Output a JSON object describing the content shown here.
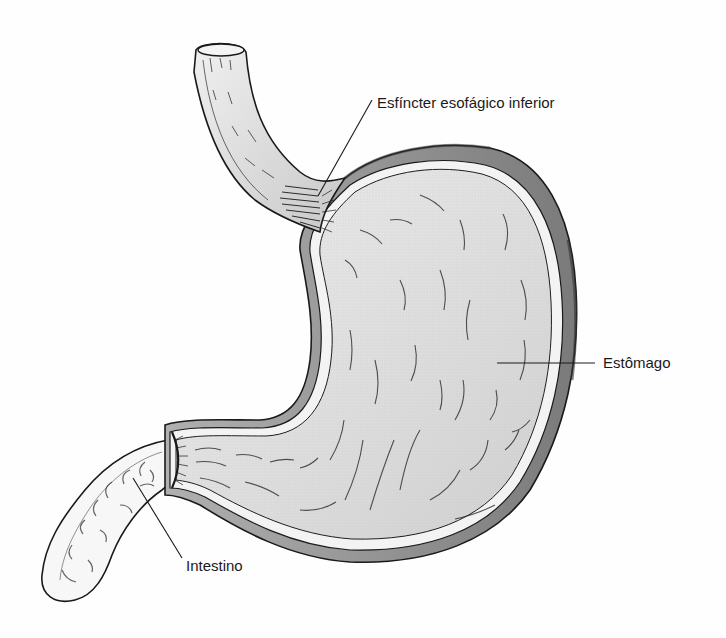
{
  "diagram": {
    "colors": {
      "background": "#fefefe",
      "organ_fill": "#d9d9d9",
      "organ_fill_light": "#ebebeb",
      "wall_fill": "#f2f2f2",
      "outline": "#1a1a1a",
      "rim_dark": "#8a8a8a"
    },
    "labels": [
      {
        "id": "les",
        "text": "Esfíncter esofágico inferior",
        "x": 377,
        "y": 95
      },
      {
        "id": "stomach",
        "text": "Estômago",
        "x": 603,
        "y": 355
      },
      {
        "id": "intestine",
        "text": "Intestino",
        "x": 186,
        "y": 558
      }
    ],
    "leader_lines": [
      {
        "for": "les",
        "x1": 372,
        "y1": 100,
        "x2": 318,
        "y2": 196
      },
      {
        "for": "stomach",
        "x1": 497,
        "y1": 363,
        "x2": 595,
        "y2": 363
      },
      {
        "for": "intestine",
        "x1": 182,
        "y1": 558,
        "x2": 133,
        "y2": 478
      }
    ]
  }
}
